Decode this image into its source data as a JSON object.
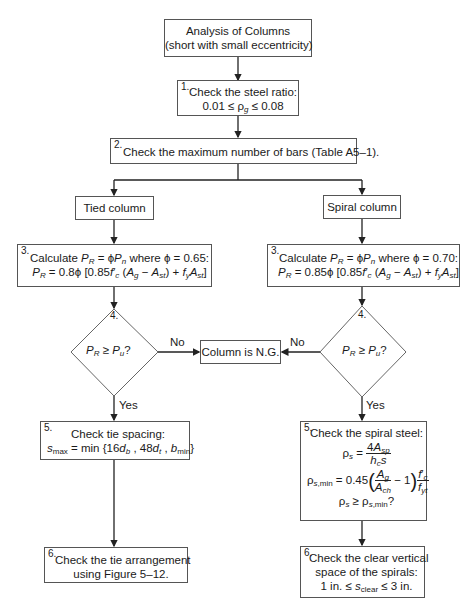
{
  "title": {
    "line1": "Analysis of Columns",
    "line2": "(short with small eccentricity)"
  },
  "step1": {
    "number": "1.",
    "line1": "Check the steel ratio:",
    "line2": "0.01 ≤ ρg ≤ 0.08"
  },
  "step2": {
    "number": "2.",
    "text": "Check the maximum number of bars (Table A5–1)."
  },
  "branches": {
    "tied": "Tied column",
    "spiral": "Spiral column"
  },
  "tied": {
    "step3": {
      "number": "3.",
      "line1": "Calculate PR = ϕPn where ϕ = 0.65:",
      "line2": "PR = 0.8ϕ [0.85f′c (Ag − Ast) + fyAst]"
    },
    "step4": {
      "number": "4.",
      "question": "PR ≥ Pu?",
      "no": "No",
      "yes": "Yes"
    },
    "step5": {
      "number": "5.",
      "line1": "Check tie spacing:",
      "line2": "smax = min {16db , 48dt , bmin}"
    },
    "step6": {
      "number": "6.",
      "line1": "Check the tie arrangement",
      "line2": "using Figure 5–12."
    }
  },
  "spiral": {
    "step3": {
      "number": "3.",
      "line1": "Calculate PR = ϕPn where ϕ = 0.70:",
      "line2": "PR = 0.85ϕ [0.85f′c (Ag − Ast) + fyAst]"
    },
    "step4": {
      "number": "4.",
      "question": "PR ≥ Pu?",
      "no": "No",
      "yes": "Yes"
    },
    "step5": {
      "number": "5.",
      "line1": "Check the spiral steel:",
      "eq1": "ρs = 4Asp / (hc s)",
      "eq2": "ρs,min = 0.45 (Ag/Ach − 1) f′c/fyt",
      "eq3": "ρs ≥ ρs,min?"
    },
    "step6": {
      "number": "6.",
      "line1": "Check the clear vertical",
      "line2": "space of the spirals:",
      "line3": "1 in. ≤ sclear ≤ 3 in."
    }
  },
  "fail": {
    "text": "Column is N.G."
  },
  "colors": {
    "line": "#222222",
    "border": "#555555",
    "background": "#ffffff"
  }
}
